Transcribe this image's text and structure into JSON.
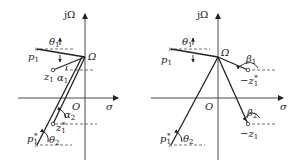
{
  "diagrams": [
    {
      "id": "left",
      "axis_labels": {
        "vertical": "jΩ",
        "horizontal": "σ",
        "origin": "O"
      },
      "points": {
        "omega": "Ω",
        "pole": "p",
        "pole_sub": "1",
        "pole_conj": "p",
        "pole_conj_sub": "1",
        "pole_conj_sup": "*",
        "zero": "z",
        "zero_sub": "1",
        "zero_conj": "z",
        "zero_conj_sub": "1",
        "zero_conj_sup": "*"
      },
      "angles": {
        "theta1": "θ",
        "theta1_sub": "1",
        "theta2": "θ",
        "theta2_sub": "2",
        "alpha1": "α",
        "alpha1_sub": "1",
        "alpha2": "α",
        "alpha2_sub": "2"
      }
    },
    {
      "id": "right",
      "axis_labels": {
        "vertical": "jΩ",
        "horizontal": "σ",
        "origin": "O"
      },
      "points": {
        "omega": "Ω",
        "pole": "p",
        "pole_sub": "1",
        "pole_conj": "p",
        "pole_conj_sub": "1",
        "pole_conj_sup": "*",
        "zero": "−z",
        "zero_sub": "1",
        "zero_conj": "−z",
        "zero_conj_sub": "1",
        "zero_conj_sup": "*"
      },
      "angles": {
        "theta1": "θ",
        "theta1_sub": "1",
        "theta2": "θ",
        "theta2_sub": "2",
        "beta1": "β",
        "beta1_sub": "1",
        "beta2": "β",
        "beta2_sub": "2"
      }
    }
  ]
}
